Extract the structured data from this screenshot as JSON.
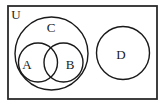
{
  "figure": {
    "type": "venn-diagram",
    "background_color": "#ffffff",
    "stroke_color": "#1a1a1a",
    "width": 165,
    "height": 109
  },
  "universe": {
    "label": "U",
    "label_x": 16,
    "label_y": 15,
    "rect": {
      "x": 8,
      "y": 6,
      "width": 149,
      "height": 93
    },
    "border_color": "#2b2b2b"
  },
  "sets": [
    {
      "label": "C",
      "cx": 51.5,
      "cy": 53.5,
      "r": 36.5,
      "label_x": 51,
      "label_y": 28
    },
    {
      "label": "A",
      "cx": 38,
      "cy": 62.5,
      "r": 19.5,
      "label_x": 27,
      "label_y": 65
    },
    {
      "label": "B",
      "cx": 63.5,
      "cy": 62.5,
      "r": 19.5,
      "label_x": 70,
      "label_y": 65
    },
    {
      "label": "D",
      "cx": 123,
      "cy": 53,
      "r": 26.5,
      "label_x": 121,
      "label_y": 55
    }
  ]
}
